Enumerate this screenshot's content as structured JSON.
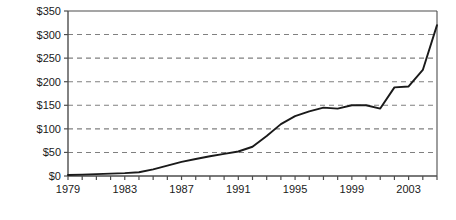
{
  "chart_data": {
    "type": "line",
    "title": "",
    "subtitle": "",
    "xlabel": "",
    "ylabel": "",
    "grid": true,
    "grid_axis": "y",
    "legend": false,
    "legend_position": "none",
    "line_color": "#1a1a1a",
    "grid_color": "#808080",
    "axis_color": "#4d4d4d",
    "background": "#ffffff",
    "xlim": [
      1979,
      2005
    ],
    "ylim": [
      0,
      350
    ],
    "y_ticks": [
      0,
      50,
      100,
      150,
      200,
      250,
      300,
      350
    ],
    "y_tick_labels": [
      "$0",
      "$50",
      "$100",
      "$150",
      "$200",
      "$250",
      "$300",
      "$350"
    ],
    "x_ticks": [
      1979,
      1980,
      1981,
      1982,
      1983,
      1984,
      1985,
      1986,
      1987,
      1988,
      1989,
      1990,
      1991,
      1992,
      1993,
      1994,
      1995,
      1996,
      1997,
      1998,
      1999,
      2000,
      2001,
      2002,
      2003,
      2004,
      2005
    ],
    "x_tick_labels_shown": [
      "1979",
      "1983",
      "1987",
      "1991",
      "1995",
      "1999",
      "2003"
    ],
    "x_tick_label_values": [
      1979,
      1983,
      1987,
      1991,
      1995,
      1999,
      2003
    ],
    "x": [
      1979,
      1980,
      1981,
      1982,
      1983,
      1984,
      1985,
      1986,
      1987,
      1988,
      1989,
      1990,
      1991,
      1992,
      1993,
      1994,
      1995,
      1996,
      1997,
      1998,
      1999,
      2000,
      2001,
      2002,
      2003,
      2004,
      2005
    ],
    "values": [
      2,
      3,
      4,
      5,
      6,
      8,
      14,
      22,
      30,
      36,
      42,
      47,
      52,
      62,
      85,
      110,
      127,
      137,
      145,
      143,
      150,
      150,
      143,
      188,
      190,
      225,
      320
    ],
    "series": [
      {
        "name": "Value",
        "values": [
          2,
          3,
          4,
          5,
          6,
          8,
          14,
          22,
          30,
          36,
          42,
          47,
          52,
          62,
          85,
          110,
          127,
          137,
          145,
          143,
          150,
          150,
          143,
          188,
          190,
          225,
          320
        ]
      }
    ],
    "annotations": []
  },
  "layout": {
    "plot_left": 68,
    "plot_right": 437,
    "plot_top": 11,
    "plot_bottom": 176,
    "width": 456,
    "height": 220
  }
}
